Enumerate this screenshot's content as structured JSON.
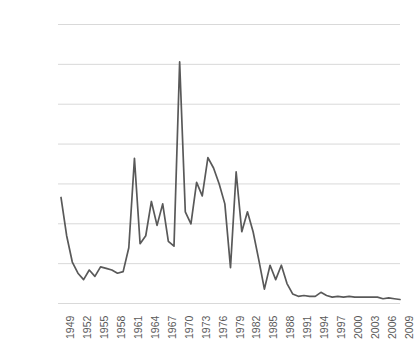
{
  "chart_data": {
    "type": "line",
    "title": "",
    "subtitle": "",
    "xlabel": "",
    "ylabel": "",
    "grid": true,
    "legend": false,
    "legend_position": "none",
    "line_color": "#595959",
    "gridline_color": "#d9d9d9",
    "tick_text_color": "#5a5a5a",
    "background_color": "#ffffff",
    "xlim": [
      1949,
      2009
    ],
    "ylim": [
      0,
      350000
    ],
    "ytick_labels": [
      "350,000",
      "300,000",
      "250,000",
      "200,000",
      "150,000",
      "100,000",
      "50,000",
      "0"
    ],
    "ytick_values": [
      350000,
      300000,
      250000,
      200000,
      150000,
      100000,
      50000,
      0
    ],
    "xtick_labels": [
      "1949",
      "1952",
      "1955",
      "1958",
      "1961",
      "1964",
      "1967",
      "1970",
      "1973",
      "1976",
      "1979",
      "1982",
      "1985",
      "1988",
      "1991",
      "1994",
      "1997",
      "2000",
      "2003",
      "2006",
      "2009"
    ],
    "xtick_values": [
      1949,
      1952,
      1955,
      1958,
      1961,
      1964,
      1967,
      1970,
      1973,
      1976,
      1979,
      1982,
      1985,
      1988,
      1991,
      1994,
      1997,
      2000,
      2003,
      2006,
      2009
    ],
    "x": [
      1949,
      1950,
      1951,
      1952,
      1953,
      1954,
      1955,
      1956,
      1957,
      1958,
      1959,
      1960,
      1961,
      1962,
      1963,
      1964,
      1965,
      1966,
      1967,
      1968,
      1969,
      1970,
      1971,
      1972,
      1973,
      1974,
      1975,
      1976,
      1977,
      1978,
      1979,
      1980,
      1981,
      1982,
      1983,
      1984,
      1985,
      1986,
      1987,
      1988,
      1989,
      1990,
      1991,
      1992,
      1993,
      1994,
      1995,
      1996,
      1997,
      1998,
      1999,
      2000,
      2001,
      2002,
      2003,
      2004,
      2005,
      2006,
      2007,
      2008,
      2009
    ],
    "values": [
      133000,
      85000,
      52000,
      38000,
      30000,
      42000,
      34000,
      46000,
      44000,
      42000,
      38000,
      40000,
      70000,
      182000,
      75000,
      85000,
      128000,
      98000,
      125000,
      78000,
      72000,
      303000,
      115000,
      100000,
      152000,
      135000,
      183000,
      170000,
      150000,
      125000,
      45000,
      165000,
      90000,
      115000,
      90000,
      55000,
      18000,
      48000,
      30000,
      48000,
      25000,
      12000,
      9000,
      10000,
      9000,
      9000,
      14000,
      10000,
      8000,
      9000,
      8000,
      9000,
      8000,
      8000,
      8000,
      8000,
      8000,
      6000,
      7000,
      6000,
      5000
    ],
    "series_name": "Annual value"
  }
}
